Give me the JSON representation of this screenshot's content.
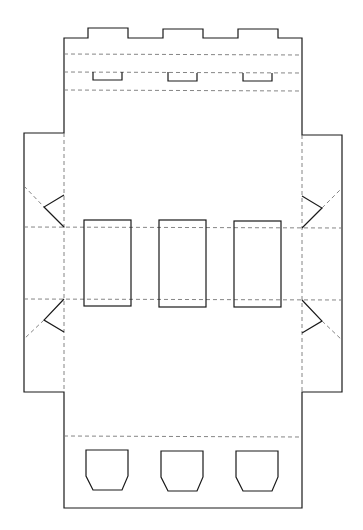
{
  "diagram": {
    "type": "box-net-dieline",
    "colors": {
      "background": "#ffffff",
      "cut_line": "#1a1a1a",
      "fold_line": "#777777"
    },
    "legend": {
      "cut": "solid line",
      "fold": "dashed line"
    },
    "panels": {
      "top_tabs": 3,
      "top_slots": 3,
      "window_cutouts": 3,
      "side_flaps": 2,
      "side_triangle_notches": 4,
      "bottom_handle_cutouts": 3
    }
  }
}
